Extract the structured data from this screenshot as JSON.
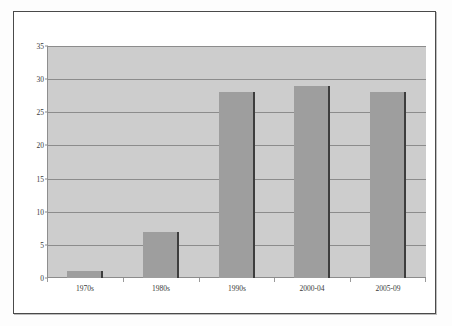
{
  "chart_data": {
    "type": "bar",
    "title": "",
    "subtitle": "",
    "xlabel": "",
    "ylabel": "",
    "categories": [
      "1970s",
      "1980s",
      "1990s",
      "2000-04",
      "2005-09"
    ],
    "values": [
      1,
      7,
      28,
      29,
      28
    ],
    "series": [
      {
        "name": "",
        "values": [
          1,
          7,
          28,
          29,
          28
        ]
      }
    ],
    "ylim": [
      0,
      35
    ],
    "yticks": [
      0,
      5,
      10,
      15,
      20,
      25,
      30,
      35
    ],
    "ytick_labels": [
      "0",
      "5",
      "10",
      "15",
      "20",
      "25",
      "30",
      "35"
    ],
    "grid": true,
    "grid_axis": "y",
    "legend": false,
    "legend_position": "none",
    "bar_color": "#9e9e9e",
    "bar_edge_color": "#3d3d3d",
    "plot_background": "#cdcdcd",
    "gridline_color": "#8c8c8c",
    "axis_text_color": "#3a3a3a",
    "frame_color": "#4a4a4a",
    "page_background": "#ffffff"
  }
}
